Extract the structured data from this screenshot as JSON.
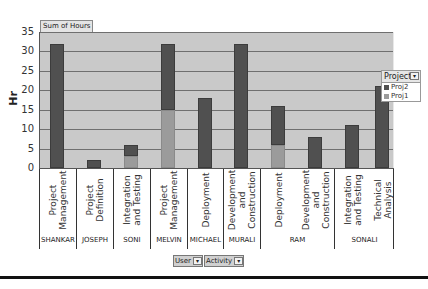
{
  "chart_data": {
    "type": "bar",
    "stacked": true,
    "title": "",
    "field_button": "Sum of Hours",
    "ylabel": "Hr",
    "xlabel": "",
    "ylim": [
      0,
      35
    ],
    "yticks": [
      0,
      5,
      10,
      15,
      20,
      25,
      30,
      35
    ],
    "grid": true,
    "legend_position": "top-right inside plot",
    "legend_title": "Project",
    "categories": [
      {
        "user": "SHANKAR",
        "activity": "Project\nManagement"
      },
      {
        "user": "JOSEPH",
        "activity": "Project\nDefinition"
      },
      {
        "user": "SONI",
        "activity": "Integration\nand Testing"
      },
      {
        "user": "MELVIN",
        "activity": "Project\nManagement"
      },
      {
        "user": "MICHAEL",
        "activity": "Deployment"
      },
      {
        "user": "MURALI",
        "activity": "Development\nand\nConstruction"
      },
      {
        "user": "RAM",
        "activity": "Deployment"
      },
      {
        "user": "RAM",
        "activity": "Development\nand\nConstruction"
      },
      {
        "user": "SONALI",
        "activity": "Integration\nand Testing"
      },
      {
        "user": "SONALI",
        "activity": "Technical\nAnalysis"
      }
    ],
    "series": [
      {
        "name": "Proj1",
        "color": "#9b9b9b",
        "values": [
          0,
          0,
          3,
          15,
          0,
          0,
          6,
          0,
          0,
          0
        ]
      },
      {
        "name": "Proj2",
        "color": "#505050",
        "values": [
          32,
          2,
          3,
          17,
          18,
          32,
          10,
          8,
          11,
          21
        ]
      }
    ],
    "totals": [
      32,
      2,
      6,
      32,
      18,
      32,
      16,
      8,
      11,
      21
    ]
  },
  "ui": {
    "sum_tag": "Sum of Hours",
    "y_label": "Hr",
    "legend": {
      "title": "Project",
      "items": [
        {
          "label": "Proj2",
          "color": "#505050"
        },
        {
          "label": "Proj1",
          "color": "#9b9b9b"
        }
      ]
    },
    "user_groups": [
      "SHANKAR",
      "JOSEPH",
      "SONI",
      "MELVIN",
      "MICHAEL",
      "MURALI",
      "RAM",
      "SONALI"
    ],
    "filters": [
      {
        "label": "User",
        "icon": "dropdown-arrow-icon"
      },
      {
        "label": "Activity",
        "icon": "dropdown-arrow-icon"
      }
    ],
    "dropdown_glyph": "▾",
    "ytick_labels": [
      "35",
      "30",
      "25",
      "20",
      "15",
      "10",
      "5",
      "0"
    ]
  }
}
